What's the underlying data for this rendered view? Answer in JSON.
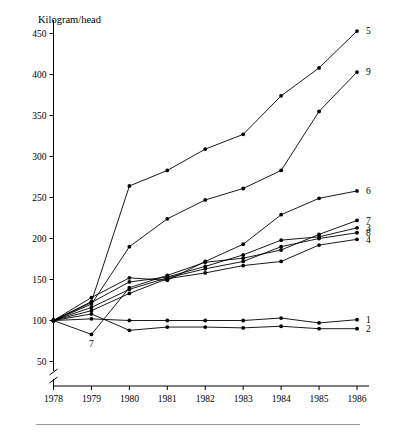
{
  "chart_data": {
    "type": "line",
    "title": "",
    "ylabel": "Kilogram/head",
    "xlabel": "",
    "x": [
      1978,
      1979,
      1980,
      1981,
      1982,
      1983,
      1984,
      1985,
      1986
    ],
    "xtick_labels": [
      "1978",
      "1979",
      "1980",
      "1981",
      "1982",
      "1983",
      "1984",
      "1985",
      "1986"
    ],
    "ytick_labels": [
      "50",
      "100",
      "150",
      "200",
      "250",
      "300",
      "350",
      "400",
      "450"
    ],
    "ytick_values": [
      50,
      100,
      150,
      200,
      250,
      300,
      350,
      400,
      450
    ],
    "ylim": [
      40,
      465
    ],
    "xlim": [
      1977.6,
      1986.6
    ],
    "grid": false,
    "axis_break": true,
    "legend_position": "right-end-of-line",
    "series": [
      {
        "name": "5",
        "label": "5",
        "values": [
          100,
          123,
          264,
          283,
          309,
          327,
          374,
          408,
          453
        ]
      },
      {
        "name": "9",
        "label": "9",
        "values": [
          100,
          120,
          190,
          224,
          247,
          261,
          283,
          355,
          403
        ]
      },
      {
        "name": "6",
        "label": "6",
        "values": [
          100,
          128,
          152,
          149,
          172,
          193,
          229,
          249,
          258
        ]
      },
      {
        "name": "7",
        "label": "7",
        "values": [
          100,
          83,
          140,
          155,
          171,
          176,
          186,
          205,
          222
        ]
      },
      {
        "name": "3",
        "label": "3",
        "values": [
          100,
          122,
          147,
          153,
          166,
          180,
          198,
          202,
          213
        ]
      },
      {
        "name": "8",
        "label": "8",
        "values": [
          100,
          116,
          138,
          152,
          163,
          172,
          190,
          200,
          207
        ]
      },
      {
        "name": "4",
        "label": "4",
        "values": [
          100,
          112,
          133,
          151,
          158,
          167,
          172,
          192,
          199
        ]
      },
      {
        "name": "1",
        "label": "1",
        "values": [
          100,
          102,
          100,
          100,
          100,
          100,
          103,
          97,
          101
        ]
      },
      {
        "name": "2",
        "label": "2",
        "values": [
          100,
          108,
          88,
          92,
          92,
          91,
          93,
          90,
          90
        ]
      }
    ],
    "annotations": [
      {
        "text": "7",
        "x": 1979,
        "y": 83,
        "position": "below-point"
      }
    ]
  }
}
